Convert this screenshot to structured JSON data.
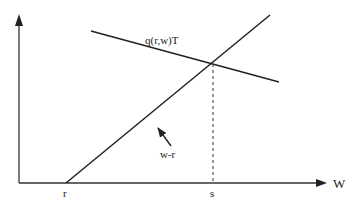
{
  "diagram": {
    "type": "economics-line-diagram",
    "axes": {
      "x_label": "W",
      "y_label": ""
    },
    "lines": [
      {
        "id": "wage-minus-reservation",
        "label": "w-r",
        "from": [
          66,
          183
        ],
        "to": [
          270,
          15
        ]
      },
      {
        "id": "q-function",
        "label": "q(r,w)T",
        "from": [
          91,
          31
        ],
        "to": [
          279,
          82
        ]
      }
    ],
    "tick_labels": {
      "r": "r",
      "s": "s"
    },
    "annotations": {
      "q_label": "q(r,w)T",
      "wr_label": "w-r"
    },
    "colors": {
      "line": "#222222",
      "axis": "#333333",
      "background": "#ffffff"
    }
  }
}
